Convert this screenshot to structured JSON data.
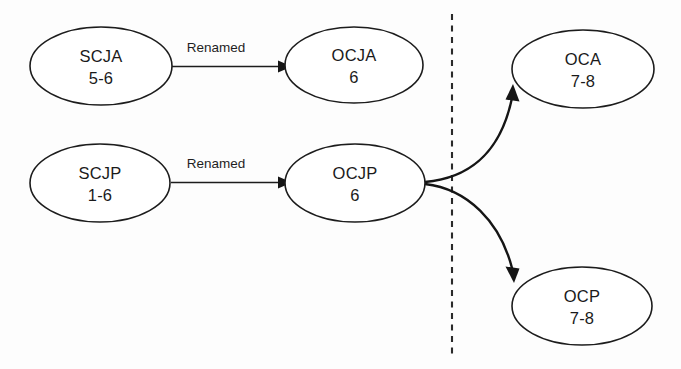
{
  "diagram": {
    "type": "flow-diagram",
    "title_visible": false,
    "background_color": "#fdfdfd",
    "stroke_color": "#1c1c1c",
    "divider": {
      "name": "vertical-dashed-divider",
      "orientation": "vertical",
      "style": "dashed",
      "x": 452,
      "y_start": 14,
      "y_end": 355
    },
    "nodes": [
      {
        "id": "scja",
        "line1": "SCJA",
        "line2": "5-6",
        "cx": 101,
        "cy": 66,
        "rx": 71,
        "ry": 39,
        "column": "left"
      },
      {
        "id": "ocja",
        "line1": "OCJA",
        "line2": "6",
        "cx": 354,
        "cy": 65,
        "rx": 69,
        "ry": 38,
        "column": "middle"
      },
      {
        "id": "oca",
        "line1": "OCA",
        "line2": "7-8",
        "cx": 583,
        "cy": 69,
        "rx": 71,
        "ry": 39,
        "column": "right"
      },
      {
        "id": "scjp",
        "line1": "SCJP",
        "line2": "1-6",
        "cx": 100,
        "cy": 183,
        "rx": 70,
        "ry": 39,
        "column": "left"
      },
      {
        "id": "ocjp",
        "line1": "OCJP",
        "line2": "6",
        "cx": 355,
        "cy": 183,
        "rx": 70,
        "ry": 39,
        "column": "middle"
      },
      {
        "id": "ocp",
        "line1": "OCP",
        "line2": "7-8",
        "cx": 582,
        "cy": 306,
        "rx": 70,
        "ry": 39,
        "column": "right"
      }
    ],
    "edges": [
      {
        "id": "scja-to-ocja",
        "from": "scja",
        "to": "ocja",
        "label": "Renamed",
        "shape": "straight",
        "label_x": 216,
        "label_y": 52
      },
      {
        "id": "scjp-to-ocjp",
        "from": "scjp",
        "to": "ocjp",
        "label": "Renamed",
        "shape": "straight",
        "label_x": 216,
        "label_y": 168
      },
      {
        "id": "ocjp-to-oca",
        "from": "ocjp",
        "to": "oca",
        "label": "",
        "shape": "curve-up"
      },
      {
        "id": "ocjp-to-ocp",
        "from": "ocjp",
        "to": "ocp",
        "label": "",
        "shape": "curve-down"
      }
    ]
  }
}
